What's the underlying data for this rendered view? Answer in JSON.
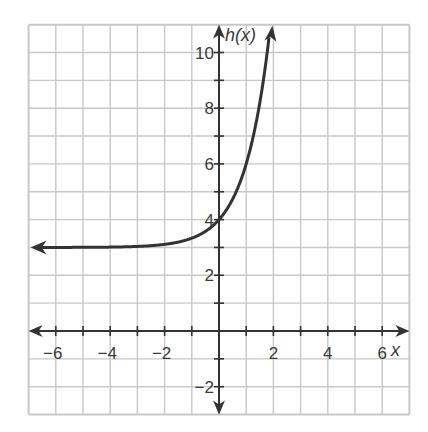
{
  "chart_data": {
    "type": "line",
    "title": "",
    "xlabel": "x",
    "ylabel": "h(x)",
    "xlim": [
      -7,
      7
    ],
    "ylim": [
      -3,
      11
    ],
    "grid": true,
    "grid_step": 1,
    "x_ticks": [
      -6,
      -4,
      -2,
      2,
      4,
      6
    ],
    "x_tick_labels": [
      "−6",
      "−4",
      "−2",
      "2",
      "4",
      "6"
    ],
    "y_ticks": [
      -2,
      2,
      4,
      6,
      8,
      10
    ],
    "y_tick_labels": [
      "−2",
      "2",
      "4",
      "6",
      "8",
      "10"
    ],
    "series": [
      {
        "name": "h(x)",
        "function": "3^x + 3",
        "horizontal_asymptote": 3,
        "x": [
          -7,
          -6,
          -4,
          -2,
          -1,
          0,
          1,
          1.5,
          2
        ],
        "values": [
          3.0,
          3.0,
          3.01,
          3.11,
          3.33,
          4,
          6,
          8.2,
          12
        ],
        "arrows": [
          "left",
          "up"
        ]
      }
    ],
    "colors": {
      "grid": "#c8c8c8",
      "axis": "#333333",
      "curve": "#333333"
    }
  }
}
